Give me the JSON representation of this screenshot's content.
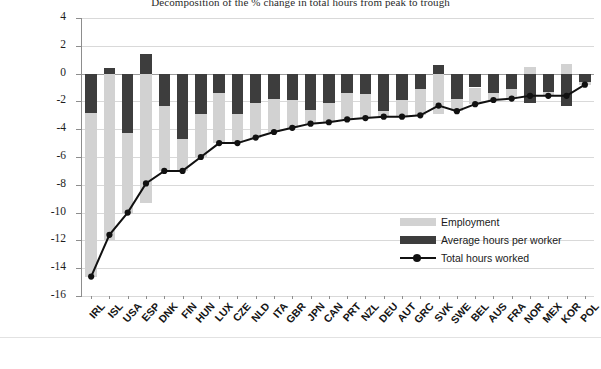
{
  "chart_data": {
    "type": "bar",
    "title": "Decomposition of the % change in total hours from peak to trough",
    "xlabel": "",
    "ylabel": "",
    "ylim": [
      -16,
      4
    ],
    "ytick_step": 2,
    "yticks": [
      "4",
      "2",
      "0",
      "-2",
      "-4",
      "-6",
      "-8",
      "-10",
      "-12",
      "-14",
      "-16"
    ],
    "grid": true,
    "legend_position": "inside-right",
    "stacked": true,
    "categories": [
      "IRL",
      "ISL",
      "USA",
      "ESP",
      "DNK",
      "FIN",
      "HUN",
      "LUX",
      "CZE",
      "NLD",
      "ITA",
      "GBR",
      "JPN",
      "CAN",
      "PRT",
      "NZL",
      "DEU",
      "AUT",
      "GRC",
      "SVK",
      "SWE",
      "BEL",
      "AUS",
      "FRA",
      "NOR",
      "MEX",
      "KOR",
      "POL"
    ],
    "series": [
      {
        "name": "Employment",
        "type": "bar",
        "color": "#d2d2d2",
        "values": [
          -11.8,
          -12.0,
          -5.7,
          -9.3,
          -4.7,
          -2.3,
          -3.1,
          -3.6,
          -2.1,
          -2.5,
          -2.4,
          -2.0,
          -1.0,
          -1.4,
          -1.9,
          -1.7,
          -0.4,
          -1.2,
          -1.9,
          -2.9,
          -0.9,
          -1.2,
          -0.5,
          -0.7,
          0.5,
          -0.3,
          0.7,
          -0.2
        ]
      },
      {
        "name": "Average hours per worker",
        "type": "bar",
        "color": "#3d3d3d",
        "values": [
          -2.8,
          0.4,
          -4.3,
          1.4,
          -2.3,
          -4.7,
          -2.9,
          -1.4,
          -2.9,
          -2.1,
          -1.8,
          -1.9,
          -2.6,
          -2.1,
          -1.4,
          -1.5,
          -2.7,
          -1.9,
          -1.1,
          0.6,
          -1.8,
          -1.0,
          -1.4,
          -1.1,
          -2.1,
          -1.3,
          -2.3,
          -0.6
        ]
      },
      {
        "name": "Total hours worked",
        "type": "line",
        "color": "#111111",
        "marker": "circle",
        "values": [
          -14.6,
          -11.6,
          -10.0,
          -7.9,
          -7.0,
          -7.0,
          -6.0,
          -5.0,
          -5.0,
          -4.6,
          -4.2,
          -3.9,
          -3.6,
          -3.5,
          -3.3,
          -3.2,
          -3.1,
          -3.1,
          -3.0,
          -2.3,
          -2.7,
          -2.2,
          -1.9,
          -1.8,
          -1.6,
          -1.6,
          -1.6,
          -0.8
        ]
      }
    ]
  },
  "legend": {
    "items": [
      {
        "label": "Employment",
        "swatch": "emp"
      },
      {
        "label": "Average hours per worker",
        "swatch": "avg"
      },
      {
        "label": "Total hours worked",
        "swatch": "line"
      }
    ]
  }
}
